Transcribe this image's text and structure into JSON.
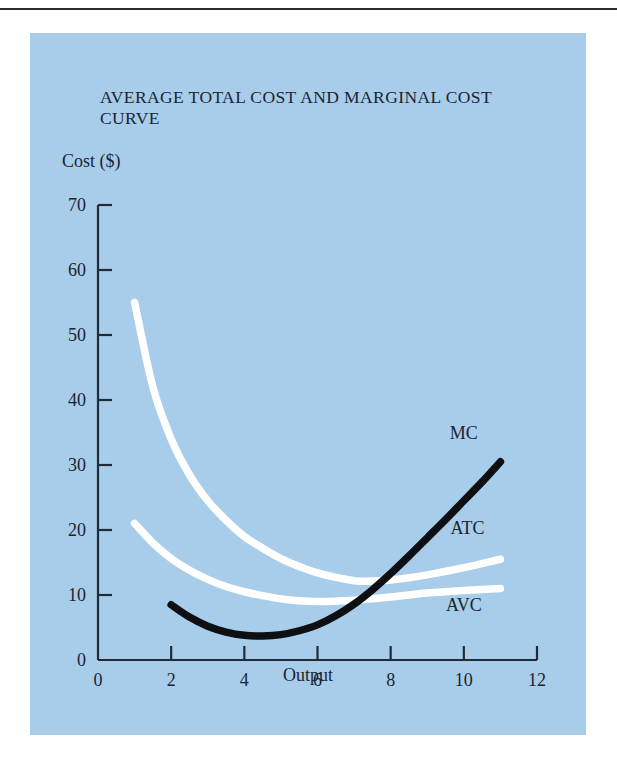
{
  "page": {
    "background_color": "#ffffff",
    "rule_color": "#2b2b2b"
  },
  "figure": {
    "panel_color": "#a8cdea",
    "title": "AVERAGE TOTAL COST AND MARGINAL COST CURVE",
    "y_axis_label": "Cost ($)",
    "x_axis_label": "Output"
  },
  "chart_data": {
    "type": "line",
    "title": "AVERAGE TOTAL COST AND MARGINAL COST CURVE",
    "xlabel": "Output",
    "ylabel": "Cost ($)",
    "xlim": [
      0,
      12
    ],
    "ylim": [
      0,
      70
    ],
    "xticks": [
      0,
      2,
      4,
      6,
      8,
      10,
      12
    ],
    "yticks": [
      0,
      10,
      20,
      30,
      40,
      50,
      60,
      70
    ],
    "xtick_labels": [
      "0",
      "2",
      "4",
      "6",
      "8",
      "10",
      "12"
    ],
    "ytick_labels": [
      "0",
      "10",
      "20",
      "30",
      "40",
      "50",
      "60",
      "70"
    ],
    "grid": false,
    "legend": "inline-curve-labels",
    "series": [
      {
        "name": "ATC",
        "label": "ATC",
        "color": "#ffffff",
        "x": [
          1.0,
          1.5,
          2.0,
          2.5,
          3.0,
          3.5,
          4.0,
          4.5,
          5.0,
          5.5,
          6.0,
          6.5,
          7.0,
          7.3,
          8.0,
          9.0,
          10.0,
          11.0
        ],
        "y": [
          55.0,
          42.0,
          34.0,
          28.5,
          24.5,
          21.5,
          19.0,
          17.2,
          15.6,
          14.4,
          13.4,
          12.7,
          12.2,
          12.1,
          12.3,
          13.1,
          14.2,
          15.5
        ]
      },
      {
        "name": "AVC",
        "label": "AVC",
        "color": "#ffffff",
        "x": [
          1.0,
          1.5,
          2.0,
          2.5,
          3.0,
          3.5,
          4.0,
          4.5,
          5.0,
          5.5,
          6.0,
          6.5,
          7.0,
          8.0,
          9.0,
          10.0,
          11.0
        ],
        "y": [
          21.0,
          18.0,
          15.6,
          13.8,
          12.4,
          11.3,
          10.5,
          9.9,
          9.4,
          9.1,
          9.0,
          9.05,
          9.2,
          9.7,
          10.3,
          10.7,
          11.0
        ]
      },
      {
        "name": "MC",
        "label": "MC",
        "color": "#0d0f12",
        "x": [
          2.0,
          2.5,
          3.0,
          3.5,
          4.0,
          4.5,
          5.0,
          5.5,
          6.0,
          6.5,
          7.0,
          7.5,
          8.0,
          8.5,
          9.0,
          9.5,
          10.0,
          10.5,
          11.0
        ],
        "y": [
          8.5,
          6.6,
          5.2,
          4.3,
          3.8,
          3.7,
          3.9,
          4.5,
          5.4,
          6.8,
          8.6,
          10.8,
          13.3,
          16.0,
          18.8,
          21.6,
          24.5,
          27.4,
          30.5
        ]
      }
    ],
    "annotations": [
      {
        "text": "MC",
        "x": 10.0,
        "y": 34.0
      },
      {
        "text": "ATC",
        "x": 10.1,
        "y": 19.4
      },
      {
        "text": "AVC",
        "x": 10.0,
        "y": 7.6
      }
    ]
  }
}
